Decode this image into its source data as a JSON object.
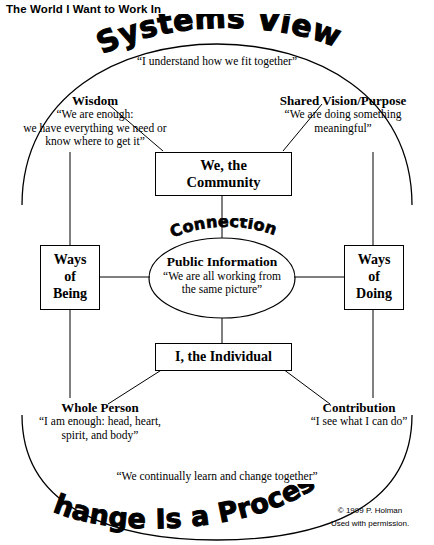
{
  "document": {
    "title": "The World I Want to Work In"
  },
  "headings": {
    "top_arc": "Systems View",
    "center_arc": "Connection",
    "bottom_arc": "Change Is a Process"
  },
  "quotes": {
    "systems_view": "“I understand how we fit together”",
    "change_is_a_process": "“We continually learn and change together”"
  },
  "labels": {
    "wisdom": {
      "title": "Wisdom",
      "quote_lines": [
        "“We are enough:",
        "we have everything we need or",
        "know where to get it”"
      ]
    },
    "shared_vision": {
      "title": "Shared Vision/Purpose",
      "quote_lines": [
        "“We are doing something",
        "meaningful”"
      ]
    },
    "whole_person": {
      "title": "Whole Person",
      "quote_lines": [
        "“I am enough: head, heart,",
        "spirit, and body”"
      ]
    },
    "contribution": {
      "title": "Contribution",
      "quote_lines": [
        "“I see what I can do”"
      ]
    }
  },
  "nodes": {
    "community": {
      "line1": "We, the",
      "line2": "Community"
    },
    "individual": {
      "line1": "I, the Individual"
    },
    "ways_of_being": {
      "line1": "Ways",
      "line2": "of",
      "line3": "Being"
    },
    "ways_of_doing": {
      "line1": "Ways",
      "line2": "of",
      "line3": "Doing"
    },
    "public_information": {
      "title": "Public Information",
      "quote_lines": [
        "“We are all working from",
        "the same picture”"
      ]
    }
  },
  "credit": {
    "copyright": "© 1999 P. Holman",
    "permission": "Used with permission."
  },
  "colors": {
    "ink": "#000000",
    "paper": "#ffffff"
  }
}
